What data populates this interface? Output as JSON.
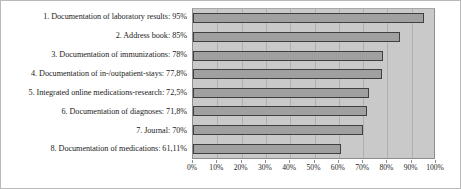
{
  "chart_data": {
    "type": "bar",
    "orientation": "horizontal",
    "title": "",
    "xlabel": "",
    "ylabel": "",
    "xlim": [
      0,
      100
    ],
    "grid": true,
    "legend": false,
    "categories": [
      "1. Documentation of laboratory results",
      "2. Address book",
      "3. Documentation of immunizations",
      "4. Documentation of in-/outpatient-stays",
      "5. Integrated online medications-research",
      "6. Documentation of diagnoses",
      "7. Journal",
      "8. Documentation of medications"
    ],
    "values": [
      95,
      85,
      78,
      77.8,
      72.5,
      71.8,
      70,
      61.11
    ],
    "value_labels": [
      "95%",
      "85%",
      "78%",
      "77,8%",
      "72,5%",
      "71,8%",
      "70%",
      "61,11%"
    ],
    "bar_labels": [
      "1. Documentation of laboratory results: 95%",
      "2. Address book: 85%",
      "3. Documentation of immunizations: 78%",
      "4. Documentation of in-/outpatient-stays: 77,8%",
      "5. Integrated online medications-research: 72,5%",
      "6. Documentation of diagnoses: 71,8%",
      "7. Journal: 70%",
      "8. Documentation of medications: 61,11%"
    ],
    "xticks": [
      0,
      10,
      20,
      30,
      40,
      50,
      60,
      70,
      80,
      90,
      100
    ],
    "xtick_labels": [
      "0%",
      "10%",
      "20%",
      "30%",
      "40%",
      "50%",
      "60%",
      "70%",
      "80%",
      "90%",
      "100%"
    ],
    "colors": {
      "bar_fill": "#a0a0a0",
      "bar_outline": "#3f3f3f",
      "plot_background": "#c9c9c9",
      "gridline": "#b0b0b0",
      "figure_background": "#ffffff",
      "figure_border": "#b9b9b9",
      "text": "#1d1d1d"
    }
  }
}
